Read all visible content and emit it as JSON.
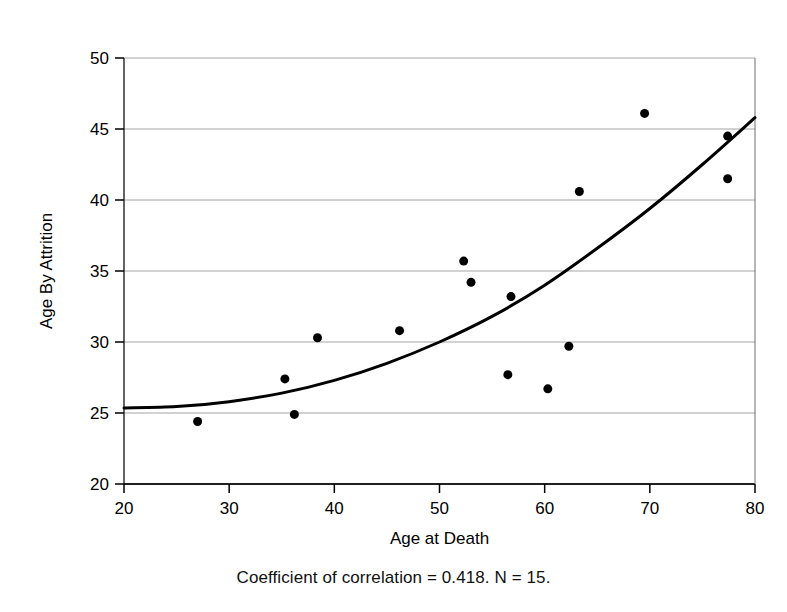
{
  "chart_data": {
    "type": "scatter",
    "title": "",
    "xlabel": "Age at Death",
    "ylabel": "Age By Attrition",
    "xlim": [
      20,
      80
    ],
    "ylim": [
      20,
      50
    ],
    "xticks": [
      20,
      30,
      40,
      50,
      60,
      70,
      80
    ],
    "yticks": [
      20,
      25,
      30,
      35,
      40,
      45,
      50
    ],
    "xtick_labels": [
      "20",
      "30",
      "40",
      "50",
      "60",
      "70",
      "80"
    ],
    "ytick_labels": [
      "20",
      "25",
      "30",
      "35",
      "40",
      "45",
      "50"
    ],
    "grid": "horizontal",
    "legend": "none",
    "marker": {
      "shape": "circle",
      "color": "#000000",
      "size": 9
    },
    "points": [
      {
        "x": 27.0,
        "y": 24.4
      },
      {
        "x": 35.3,
        "y": 27.4
      },
      {
        "x": 36.2,
        "y": 24.9
      },
      {
        "x": 38.4,
        "y": 30.3
      },
      {
        "x": 46.2,
        "y": 30.8
      },
      {
        "x": 52.3,
        "y": 35.7
      },
      {
        "x": 53.0,
        "y": 34.2
      },
      {
        "x": 56.8,
        "y": 33.2
      },
      {
        "x": 56.5,
        "y": 27.7
      },
      {
        "x": 60.3,
        "y": 26.7
      },
      {
        "x": 62.3,
        "y": 29.7
      },
      {
        "x": 63.3,
        "y": 40.6
      },
      {
        "x": 69.5,
        "y": 46.1
      },
      {
        "x": 77.4,
        "y": 44.5
      },
      {
        "x": 77.4,
        "y": 41.5
      }
    ],
    "fit_curve": {
      "name": "trend-curve",
      "color": "#000000",
      "width": 3,
      "points": [
        {
          "x": 20,
          "y": 25.35
        },
        {
          "x": 25,
          "y": 25.45
        },
        {
          "x": 30,
          "y": 25.8
        },
        {
          "x": 35,
          "y": 26.4
        },
        {
          "x": 40,
          "y": 27.3
        },
        {
          "x": 45,
          "y": 28.5
        },
        {
          "x": 50,
          "y": 30.0
        },
        {
          "x": 55,
          "y": 31.8
        },
        {
          "x": 60,
          "y": 34.0
        },
        {
          "x": 65,
          "y": 36.6
        },
        {
          "x": 70,
          "y": 39.4
        },
        {
          "x": 75,
          "y": 42.5
        },
        {
          "x": 80,
          "y": 45.8
        }
      ]
    },
    "annotations": {
      "caption": "Coefficient of correlation = 0.418. N = 15."
    },
    "coefficient_of_correlation": 0.418,
    "n": 15
  },
  "caption": "Coefficient of correlation = 0.418. N = 15."
}
